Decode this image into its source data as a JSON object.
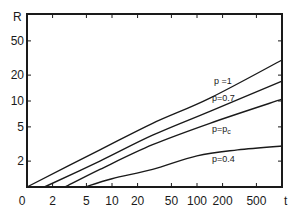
{
  "chart_data": {
    "type": "line",
    "title": "",
    "xlabel": "t",
    "ylabel": "R",
    "xscale": "log",
    "yscale": "log",
    "xlim": [
      1,
      1000
    ],
    "ylim": [
      1,
      80
    ],
    "grid": false,
    "legend": "inline labels near right end of curves",
    "x_ticks": [
      1,
      2,
      5,
      10,
      20,
      50,
      100,
      200,
      500
    ],
    "x_tick_labels": [
      "0",
      "2",
      "5",
      "10",
      "20",
      "50",
      "100",
      "200",
      "500"
    ],
    "y_ticks": [
      2,
      5,
      10,
      20,
      50
    ],
    "y_tick_labels": [
      "2",
      "5",
      "10",
      "20",
      "50"
    ],
    "series": [
      {
        "name": "p=1",
        "label": "p =1",
        "points": [
          [
            1,
            1
          ],
          [
            7.2,
            2.7
          ],
          [
            30,
            5.5
          ],
          [
            142,
            10.8
          ],
          [
            1000,
            30
          ]
        ]
      },
      {
        "name": "p=0.7",
        "label": "p=0.7",
        "points": [
          [
            1.6,
            1
          ],
          [
            7.2,
            2.0
          ],
          [
            30,
            4.0
          ],
          [
            142,
            7.6
          ],
          [
            1000,
            17
          ]
        ]
      },
      {
        "name": "p=pc",
        "label": "p=p",
        "label_sub": "c",
        "points": [
          [
            2.8,
            1
          ],
          [
            7.2,
            1.6
          ],
          [
            30,
            3.1
          ],
          [
            142,
            5.5
          ],
          [
            1000,
            10.5
          ]
        ]
      },
      {
        "name": "p=0.4",
        "label": "p=0.4",
        "points": [
          [
            4.8,
            1
          ],
          [
            10,
            1.25
          ],
          [
            30,
            1.6
          ],
          [
            100,
            2.3
          ],
          [
            300,
            2.7
          ],
          [
            1000,
            3.0
          ]
        ]
      }
    ]
  },
  "labels": {
    "y_axis": "R",
    "x_axis": "t",
    "curve_p1": "p =1",
    "curve_p07": "p=0.7",
    "curve_pc": "p=p",
    "curve_pc_sub": "c",
    "curve_p04": "p=0.4"
  }
}
